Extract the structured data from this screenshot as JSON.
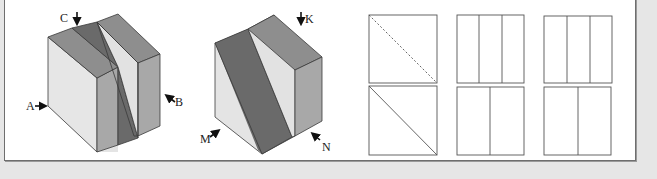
{
  "figure": {
    "cube_left": {
      "labels": [
        {
          "id": "A",
          "text": "A",
          "arrow": "right"
        },
        {
          "id": "B",
          "text": "B",
          "arrow": "up-left"
        },
        {
          "id": "C",
          "text": "C",
          "arrow": "down"
        }
      ]
    },
    "cube_right": {
      "labels": [
        {
          "id": "K",
          "text": "K",
          "arrow": "down"
        },
        {
          "id": "M",
          "text": "M",
          "arrow": "up-right"
        },
        {
          "id": "N",
          "text": "N",
          "arrow": "up-left"
        }
      ]
    },
    "views": [
      {
        "column": 1,
        "row": 1,
        "type": "square",
        "lines": "dashed diagonal top-left to bottom-right"
      },
      {
        "column": 1,
        "row": 2,
        "type": "square",
        "lines": "solid diagonal top-left to bottom-right"
      },
      {
        "column": 2,
        "row": 1,
        "type": "square",
        "lines": "two vertical dividers (three strips)"
      },
      {
        "column": 2,
        "row": 2,
        "type": "square",
        "lines": "one vertical divider at ~45%"
      },
      {
        "column": 3,
        "row": 1,
        "type": "square",
        "lines": "two vertical dividers (three strips)"
      },
      {
        "column": 3,
        "row": 2,
        "type": "square",
        "lines": "one vertical divider at ~50%"
      }
    ],
    "colors": {
      "background": "#e6e6e6",
      "panel": "#ffffff",
      "face_light": "#e4e4e4",
      "face_mid": "#a8a8a8",
      "face_top": "#8c8c8c",
      "face_dark": "#6a6a6a",
      "stroke": "#3a3a3a"
    }
  }
}
